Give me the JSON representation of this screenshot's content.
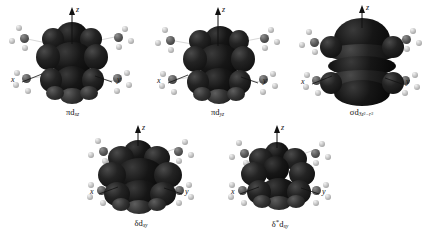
{
  "figure": {
    "background_color": "#ffffff",
    "orbital_surface_color": "#1a1a1a",
    "carbon_atom_color": "#5d5d5d",
    "hydrogen_atom_color": "#c6c6c6"
  },
  "panels": [
    {
      "id": "pi-dxz",
      "caption_symmetry": "π",
      "caption_orbital": "d",
      "caption_subscript": "xz",
      "caption_full": "πdₓₓ",
      "axes": {
        "z": "z",
        "x": "x",
        "y": "y"
      },
      "row": 1,
      "column": 1
    },
    {
      "id": "pi-dyz",
      "caption_symmetry": "π",
      "caption_orbital": "d",
      "caption_subscript": "yz",
      "caption_full": "πdᵧᵤ",
      "axes": {
        "z": "z",
        "x": "x",
        "y": "y"
      },
      "row": 1,
      "column": 2
    },
    {
      "id": "sigma-d3z2-r2",
      "caption_symmetry": "σ",
      "caption_orbital": "d",
      "caption_subscript": "3z",
      "caption_subscript_sup1": "2",
      "caption_subscript_mid": "−r",
      "caption_subscript_sup2": "2",
      "caption_full": "σd₃ₓ²₋ᵣ²",
      "axes": {
        "z": "z",
        "x": "x",
        "y": "y"
      },
      "row": 1,
      "column": 3
    },
    {
      "id": "delta-dxy",
      "caption_symmetry": "δ",
      "caption_orbital": "d",
      "caption_subscript": "xy",
      "caption_full": "δdₓᵧ",
      "axes": {
        "z": "z",
        "x": "x",
        "y": "y"
      },
      "row": 2,
      "column": 1
    },
    {
      "id": "delta-star-dxy",
      "caption_symmetry": "δ",
      "caption_star": "*",
      "caption_orbital": "d",
      "caption_subscript": "xy",
      "caption_full": "δ*dₓᵧ",
      "axes": {
        "z": "z",
        "x": "x",
        "y": "y"
      },
      "row": 2,
      "column": 2
    }
  ]
}
